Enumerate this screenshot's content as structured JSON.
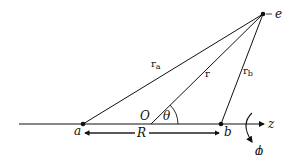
{
  "diagram": {
    "type": "geometry",
    "labels": {
      "a": "a",
      "b": "b",
      "e": "e",
      "O": "O",
      "R": "R",
      "theta": "θ",
      "z": "z",
      "phi": "ϕ",
      "r": "r",
      "ra_main": "r",
      "ra_sub": "a",
      "rb_main": "r",
      "rb_sub": "b"
    },
    "colors": {
      "line": "#111111",
      "background": "#ffffff"
    }
  }
}
